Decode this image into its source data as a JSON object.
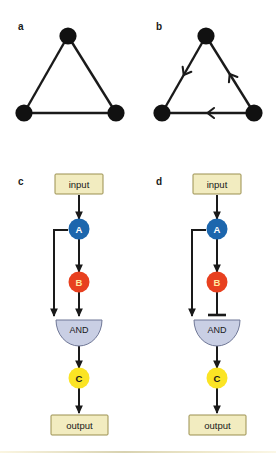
{
  "figure": {
    "background": "#ffffff",
    "panels": [
      {
        "id": "a",
        "label": "a",
        "type": "undirected-triangle-graph",
        "node_color": "#111111",
        "edge_color": "#1a1a1a",
        "nodes": [
          {
            "name": "top",
            "cx": 68,
            "cy": 36,
            "r": 8.5
          },
          {
            "name": "bottom-left",
            "cx": 24,
            "cy": 113,
            "r": 8.5
          },
          {
            "name": "bottom-right",
            "cx": 116,
            "cy": 113,
            "r": 8.5
          }
        ],
        "edges": [
          {
            "from": "top",
            "to": "bottom-left",
            "directed": false
          },
          {
            "from": "top",
            "to": "bottom-right",
            "directed": false
          },
          {
            "from": "bottom-left",
            "to": "bottom-right",
            "directed": false
          }
        ]
      },
      {
        "id": "b",
        "label": "b",
        "type": "directed-triangle-graph",
        "node_color": "#111111",
        "edge_color": "#1a1a1a",
        "nodes": [
          {
            "name": "top",
            "cx": 68,
            "cy": 36,
            "r": 8.5
          },
          {
            "name": "bottom-left",
            "cx": 24,
            "cy": 113,
            "r": 8.5
          },
          {
            "name": "bottom-right",
            "cx": 116,
            "cy": 113,
            "r": 8.5
          }
        ],
        "edges": [
          {
            "from": "top",
            "to": "bottom-left",
            "directed": true,
            "arrow_at": 0.5,
            "direction": "down-left"
          },
          {
            "from": "bottom-right",
            "to": "top",
            "directed": true,
            "arrow_at": 0.5,
            "direction": "up-left"
          },
          {
            "from": "bottom-right",
            "to": "bottom-left",
            "directed": true,
            "arrow_at": 0.5,
            "direction": "left"
          }
        ]
      },
      {
        "id": "c",
        "label": "c",
        "type": "logic-circuit",
        "variant": "activating",
        "colors": {
          "box_fill": "#f2ecc0",
          "box_stroke": "#9a8f4e",
          "node_a_fill": "#1c66ad",
          "node_b_fill": "#e8401f",
          "node_c_fill": "#fbe424",
          "gate_fill": "#c9cfe4",
          "gate_stroke": "#6f7796",
          "edge_color": "#1a1a1a"
        },
        "elements": {
          "input_box": {
            "label": "input"
          },
          "node_a": {
            "label": "A"
          },
          "node_b": {
            "label": "B"
          },
          "gate": {
            "label": "AND"
          },
          "node_c": {
            "label": "C"
          },
          "output_box": {
            "label": "output"
          }
        },
        "connections": [
          {
            "from": "input",
            "to": "node_a",
            "type": "arrow"
          },
          {
            "from": "node_a",
            "to": "node_b",
            "type": "arrow"
          },
          {
            "from": "node_a",
            "to": "gate",
            "type": "arrow",
            "route": "bypass-left"
          },
          {
            "from": "node_b",
            "to": "gate",
            "type": "arrow"
          },
          {
            "from": "gate",
            "to": "node_c",
            "type": "arrow"
          },
          {
            "from": "node_c",
            "to": "output",
            "type": "arrow"
          }
        ]
      },
      {
        "id": "d",
        "label": "d",
        "type": "logic-circuit",
        "variant": "inhibiting",
        "colors": {
          "box_fill": "#f2ecc0",
          "box_stroke": "#9a8f4e",
          "node_a_fill": "#1c66ad",
          "node_b_fill": "#e8401f",
          "node_c_fill": "#fbe424",
          "gate_fill": "#c9cfe4",
          "gate_stroke": "#6f7796",
          "edge_color": "#1a1a1a"
        },
        "elements": {
          "input_box": {
            "label": "input"
          },
          "node_a": {
            "label": "A"
          },
          "node_b": {
            "label": "B"
          },
          "gate": {
            "label": "AND"
          },
          "node_c": {
            "label": "C"
          },
          "output_box": {
            "label": "output"
          }
        },
        "connections": [
          {
            "from": "input",
            "to": "node_a",
            "type": "arrow"
          },
          {
            "from": "node_a",
            "to": "node_b",
            "type": "arrow"
          },
          {
            "from": "node_a",
            "to": "gate",
            "type": "arrow",
            "route": "bypass-left"
          },
          {
            "from": "node_b",
            "to": "gate",
            "type": "inhibition-bar"
          },
          {
            "from": "gate",
            "to": "node_c",
            "type": "arrow"
          },
          {
            "from": "node_c",
            "to": "output",
            "type": "arrow"
          }
        ]
      }
    ],
    "footer_rule": {
      "color": "#d8d2b0"
    }
  }
}
